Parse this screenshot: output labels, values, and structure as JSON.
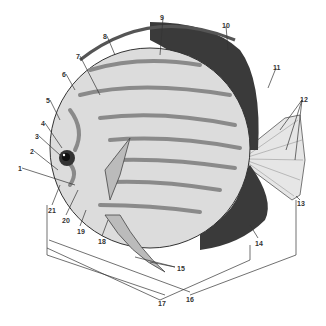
{
  "diagram": {
    "colors": {
      "body": "#d9d9d9",
      "stripe": "#8a8a8a",
      "dark": "#2b2b2b",
      "line": "#333333",
      "fin": "#bfbfbf"
    },
    "labels": [
      {
        "id": "1",
        "text": "1",
        "x": 18,
        "y": 165
      },
      {
        "id": "2",
        "text": "2",
        "x": 30,
        "y": 148
      },
      {
        "id": "3",
        "text": "3",
        "x": 35,
        "y": 133
      },
      {
        "id": "4",
        "text": "4",
        "x": 41,
        "y": 120
      },
      {
        "id": "5",
        "text": "5",
        "x": 46,
        "y": 97
      },
      {
        "id": "6",
        "text": "6",
        "x": 62,
        "y": 71
      },
      {
        "id": "7",
        "text": "7",
        "x": 76,
        "y": 53
      },
      {
        "id": "8",
        "text": "8",
        "x": 103,
        "y": 33
      },
      {
        "id": "9",
        "text": "9",
        "x": 160,
        "y": 14
      },
      {
        "id": "10",
        "text": "10",
        "x": 222,
        "y": 22
      },
      {
        "id": "11",
        "text": "11",
        "x": 273,
        "y": 64
      },
      {
        "id": "12",
        "text": "12",
        "x": 300,
        "y": 96
      },
      {
        "id": "13",
        "text": "13",
        "x": 297,
        "y": 200
      },
      {
        "id": "14",
        "text": "14",
        "x": 255,
        "y": 240
      },
      {
        "id": "15",
        "text": "15",
        "x": 177,
        "y": 265
      },
      {
        "id": "16",
        "text": "16",
        "x": 186,
        "y": 296
      },
      {
        "id": "17",
        "text": "17",
        "x": 158,
        "y": 300
      },
      {
        "id": "18",
        "text": "18",
        "x": 98,
        "y": 238
      },
      {
        "id": "19",
        "text": "19",
        "x": 77,
        "y": 228
      },
      {
        "id": "20",
        "text": "20",
        "x": 62,
        "y": 217
      },
      {
        "id": "21",
        "text": "21",
        "x": 48,
        "y": 207
      }
    ]
  }
}
